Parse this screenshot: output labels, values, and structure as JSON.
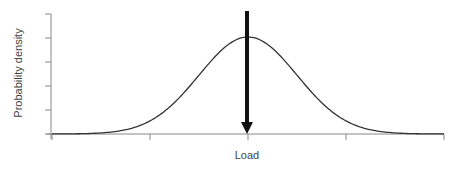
{
  "chart_data": {
    "type": "line",
    "title": "",
    "xlabel": "Load",
    "ylabel": "Probability density",
    "series": [
      {
        "name": "Load distribution (normal)",
        "x": [
          -4,
          -3.5,
          -3,
          -2.5,
          -2,
          -1.5,
          -1,
          -0.5,
          0,
          0.5,
          1,
          1.5,
          2,
          2.5,
          3,
          3.5,
          4
        ],
        "values": [
          0.0003,
          0.0022,
          0.0111,
          0.0439,
          0.1353,
          0.3247,
          0.6065,
          0.8825,
          1.0,
          0.8825,
          0.6065,
          0.3247,
          0.1353,
          0.0439,
          0.0111,
          0.0022,
          0.0003
        ]
      }
    ],
    "annotations": [
      {
        "type": "arrow",
        "direction": "down",
        "x": 0,
        "description": "Downward arrow marking the mean load at the distribution peak"
      }
    ],
    "x_ticks": 5,
    "y_ticks": 6,
    "tick_labels_shown": false,
    "grid": false,
    "legend": "none",
    "colors": {
      "curve": "#333333",
      "arrow": "#111111",
      "axis": "#888888"
    }
  },
  "labels": {
    "x_axis": "Load",
    "y_axis": "Probability density"
  }
}
